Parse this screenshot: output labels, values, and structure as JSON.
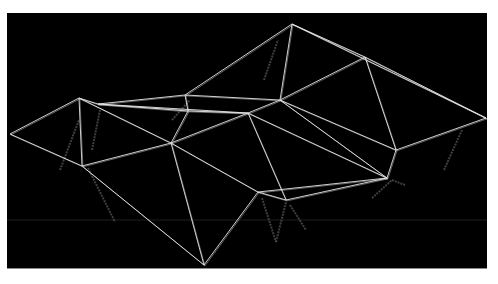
{
  "scene": {
    "title": "3D wireframe triangulated mesh render",
    "background": "#000000",
    "frame": "#ffffff",
    "line_color": "#e6e6e6",
    "shadow_color": "#5a5a5a",
    "vertices": {
      "A": [
        10,
        134
      ],
      "B": [
        79,
        98
      ],
      "C": [
        98,
        104
      ],
      "D": [
        185,
        95
      ],
      "E": [
        188,
        111
      ],
      "F": [
        248,
        113
      ],
      "G": [
        280,
        100
      ],
      "H": [
        292,
        24
      ],
      "I": [
        365,
        57
      ],
      "J": [
        486,
        118
      ],
      "K": [
        396,
        150
      ],
      "L": [
        387,
        178
      ],
      "M": [
        286,
        200
      ],
      "N": [
        171,
        143
      ],
      "O": [
        82,
        166
      ],
      "P": [
        204,
        265
      ],
      "Q": [
        258,
        192
      ]
    },
    "edges": [
      [
        "A",
        "B"
      ],
      [
        "A",
        "O"
      ],
      [
        "B",
        "O"
      ],
      [
        "B",
        "C"
      ],
      [
        "B",
        "N"
      ],
      [
        "C",
        "D"
      ],
      [
        "C",
        "E"
      ],
      [
        "C",
        "F"
      ],
      [
        "D",
        "E"
      ],
      [
        "D",
        "G"
      ],
      [
        "D",
        "H"
      ],
      [
        "E",
        "F"
      ],
      [
        "E",
        "N"
      ],
      [
        "F",
        "G"
      ],
      [
        "F",
        "N"
      ],
      [
        "F",
        "M"
      ],
      [
        "F",
        "L"
      ],
      [
        "G",
        "H"
      ],
      [
        "G",
        "I"
      ],
      [
        "G",
        "L"
      ],
      [
        "G",
        "K"
      ],
      [
        "H",
        "I"
      ],
      [
        "H",
        "J"
      ],
      [
        "I",
        "J"
      ],
      [
        "I",
        "K"
      ],
      [
        "J",
        "K"
      ],
      [
        "K",
        "L"
      ],
      [
        "L",
        "M"
      ],
      [
        "M",
        "Q"
      ],
      [
        "N",
        "O"
      ],
      [
        "N",
        "P"
      ],
      [
        "N",
        "Q"
      ],
      [
        "O",
        "P"
      ],
      [
        "P",
        "Q"
      ],
      [
        "Q",
        "L"
      ]
    ],
    "shadow_edges": [
      [
        [
          60,
          170
        ],
        [
          79,
          120
        ]
      ],
      [
        [
          92,
          150
        ],
        [
          100,
          110
        ]
      ],
      [
        [
          88,
          168
        ],
        [
          115,
          222
        ]
      ],
      [
        [
          264,
          80
        ],
        [
          278,
          40
        ]
      ],
      [
        [
          172,
          120
        ],
        [
          190,
          100
        ]
      ],
      [
        [
          262,
          198
        ],
        [
          276,
          242
        ]
      ],
      [
        [
          276,
          242
        ],
        [
          286,
          202
        ]
      ],
      [
        [
          290,
          205
        ],
        [
          306,
          230
        ]
      ],
      [
        [
          372,
          198
        ],
        [
          392,
          180
        ]
      ],
      [
        [
          392,
          180
        ],
        [
          405,
          185
        ]
      ],
      [
        [
          444,
          170
        ],
        [
          462,
          130
        ]
      ]
    ],
    "horizon_line_y": 220
  }
}
